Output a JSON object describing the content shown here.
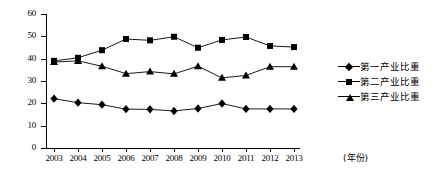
{
  "chart_data": {
    "type": "line",
    "title": "",
    "xlabel": "(年份)",
    "ylabel": "",
    "categories": [
      "2003",
      "2004",
      "2005",
      "2006",
      "2007",
      "2008",
      "2009",
      "2010",
      "2011",
      "2012",
      "2013"
    ],
    "x": [
      2003,
      2004,
      2005,
      2006,
      2007,
      2008,
      2009,
      2010,
      2011,
      2012,
      2013
    ],
    "ylim": [
      0,
      60
    ],
    "ytick_values": [
      0,
      10,
      20,
      30,
      40,
      50,
      60
    ],
    "ytick_labels": [
      "0",
      "10",
      "20",
      "30",
      "40",
      "50",
      "60"
    ],
    "grid": false,
    "legend_position": "right",
    "series": [
      {
        "name": "第一产业比重",
        "marker": "diamond",
        "color": "#000000",
        "values": [
          22.1,
          20.3,
          19.4,
          17.4,
          17.3,
          16.6,
          17.7,
          19.9,
          17.5,
          17.5,
          17.5
        ]
      },
      {
        "name": "第二产业比重",
        "marker": "square",
        "color": "#000000",
        "values": [
          39.0,
          40.4,
          43.8,
          48.8,
          48.2,
          49.8,
          44.9,
          48.4,
          49.7,
          45.7,
          45.2
        ]
      },
      {
        "name": "第三产业比重",
        "marker": "triangle",
        "color": "#000000",
        "values": [
          38.5,
          39.0,
          36.6,
          33.3,
          34.2,
          33.2,
          36.6,
          31.4,
          32.5,
          36.4,
          36.4
        ]
      }
    ]
  },
  "legend": {
    "items": [
      {
        "label": "第一产业比重",
        "marker": "diamond"
      },
      {
        "label": "第二产业比重",
        "marker": "square"
      },
      {
        "label": "第三产业比重",
        "marker": "triangle"
      }
    ]
  }
}
